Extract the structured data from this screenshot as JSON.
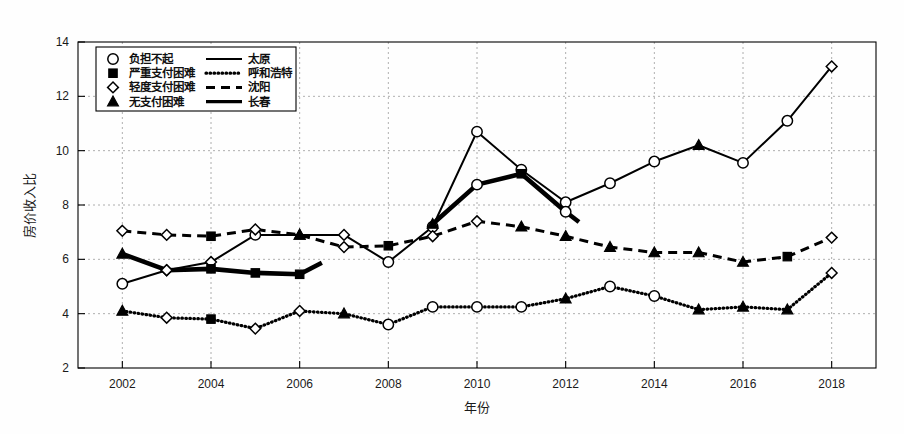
{
  "chart_data": {
    "type": "line",
    "title": "",
    "xlabel": "年份",
    "ylabel": "房价收入比",
    "xlim": [
      2001,
      2019
    ],
    "ylim": [
      2,
      14
    ],
    "ytick_step": 2,
    "xtick_step": 2,
    "grid": true,
    "legend_position": "top-left",
    "x": [
      2002,
      2003,
      2004,
      2005,
      2006,
      2007,
      2008,
      2009,
      2010,
      2011,
      2012,
      2013,
      2014,
      2015,
      2016,
      2017,
      2018
    ],
    "xticks": [
      "2002",
      "2004",
      "2006",
      "2008",
      "2010",
      "2012",
      "2014",
      "2016",
      "2018"
    ],
    "yticks": [
      "2",
      "4",
      "6",
      "8",
      "10",
      "12",
      "14"
    ],
    "marker_categories": [
      {
        "key": "unaffordable",
        "label": "负担不起",
        "marker": "circle"
      },
      {
        "key": "severe",
        "label": "严重支付困难",
        "marker": "square"
      },
      {
        "key": "mild",
        "label": "轻度支付困难",
        "marker": "diamond"
      },
      {
        "key": "none",
        "label": "无支付困难",
        "marker": "triangle"
      }
    ],
    "series": [
      {
        "name": "太原",
        "style": "solid",
        "x": [
          2002,
          2003,
          2004,
          2005,
          2006,
          2007,
          2008,
          2009,
          2010,
          2011,
          2012,
          2013,
          2014,
          2015,
          2016,
          2017,
          2018
        ],
        "values": [
          5.1,
          5.6,
          5.9,
          6.9,
          6.9,
          6.9,
          5.9,
          7.2,
          10.7,
          9.3,
          8.1,
          8.8,
          9.6,
          10.2,
          9.55,
          11.1,
          13.1
        ],
        "markers": [
          "circle",
          "diamond",
          "diamond",
          "circle",
          "triangle",
          "diamond",
          "circle",
          "circle",
          "circle",
          "circle",
          "circle",
          "circle",
          "circle",
          "triangle",
          "circle",
          "circle",
          "diamond"
        ]
      },
      {
        "name": "呼和浩特",
        "style": "dotted",
        "x": [
          2002,
          2003,
          2004,
          2005,
          2006,
          2007,
          2008,
          2009,
          2010,
          2011,
          2012,
          2013,
          2014,
          2015,
          2016,
          2017,
          2018
        ],
        "values": [
          4.1,
          3.85,
          3.8,
          3.45,
          4.1,
          4.0,
          3.6,
          4.25,
          4.25,
          4.25,
          4.55,
          5.0,
          4.65,
          4.15,
          4.25,
          4.15,
          5.5
        ],
        "markers": [
          "triangle",
          "diamond",
          "square",
          "diamond",
          "diamond",
          "triangle",
          "circle",
          "circle",
          "circle",
          "circle",
          "triangle",
          "circle",
          "circle",
          "triangle",
          "triangle",
          "triangle",
          "diamond"
        ]
      },
      {
        "name": "沈阳",
        "style": "dashed",
        "x": [
          2002,
          2003,
          2004,
          2005,
          2006,
          2007,
          2008,
          2009,
          2010,
          2011,
          2012,
          2013,
          2014,
          2015,
          2016,
          2017,
          2018
        ],
        "values": [
          7.05,
          6.9,
          6.85,
          7.1,
          6.9,
          6.45,
          6.5,
          6.85,
          7.4,
          7.2,
          6.85,
          6.45,
          6.25,
          6.25,
          5.9,
          6.1,
          6.8
        ],
        "markers": [
          "diamond",
          "diamond",
          "square",
          "diamond",
          "triangle",
          "diamond",
          "square",
          "diamond",
          "diamond",
          "triangle",
          "triangle",
          "triangle",
          "triangle",
          "triangle",
          "triangle",
          "square",
          "diamond"
        ]
      },
      {
        "name": "长春",
        "style": "thick-solid",
        "x": [
          2002,
          2003,
          2004,
          2005,
          2006,
          2007,
          2008,
          2009,
          2010,
          2011,
          2012,
          2013,
          2014,
          2015,
          2016,
          2017,
          2018
        ],
        "values": [
          6.2,
          5.6,
          5.65,
          5.5,
          5.45,
          6.3,
          6.25,
          7.3,
          8.75,
          9.15,
          7.75,
          6.5,
          6.0,
          5.45,
          5.55,
          6.2,
          6.25
        ],
        "markers": [
          "triangle",
          "diamond",
          "square",
          "square",
          "square",
          "diamond",
          "diamond",
          "triangle",
          "circle",
          "square",
          "circle",
          "triangle",
          "diamond",
          "diamond",
          "diamond",
          "diamond",
          "circle"
        ],
        "segments": [
          [
            2002,
            2006.5
          ],
          [
            2008.6,
            2012.3
          ]
        ]
      }
    ],
    "legend_entries": [
      {
        "marker_label": "负担不起",
        "marker": "circle",
        "line_label": "太原",
        "line_style": "solid"
      },
      {
        "marker_label": "严重支付困难",
        "marker": "square",
        "line_label": "呼和浩特",
        "line_style": "dotted"
      },
      {
        "marker_label": "轻度支付困难",
        "marker": "diamond",
        "line_label": "沈阳",
        "line_style": "dashed"
      },
      {
        "marker_label": "无支付困难",
        "marker": "triangle",
        "line_label": "长春",
        "line_style": "thick-solid"
      }
    ],
    "colors": {
      "line": "#000000",
      "grid": "#9a9a9a",
      "axis": "#000000",
      "background": "#fefefe"
    }
  }
}
